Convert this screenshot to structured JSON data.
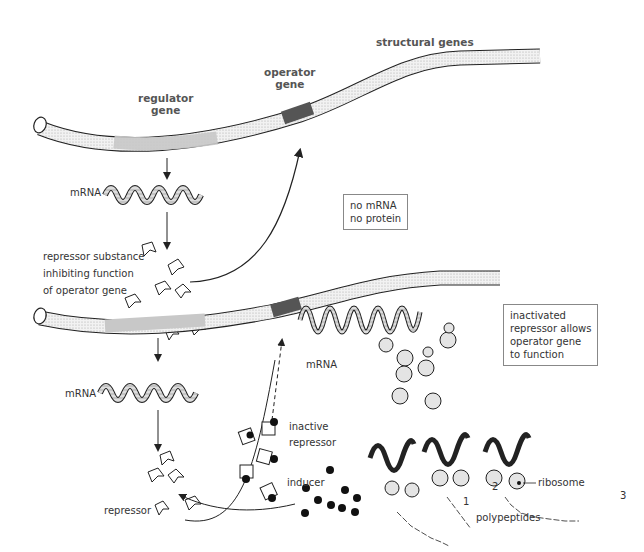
{
  "colors": {
    "background": "#ffffff",
    "ink": "#222222",
    "operator": "#555555",
    "regulator": "#c8c8c8",
    "segment": "#e8e8e8"
  },
  "top_panel": {
    "labels": {
      "regulator_gene": [
        "regulator",
        "gene"
      ],
      "operator_gene": [
        "operator",
        "gene"
      ],
      "structural_genes": "structural genes",
      "mrna": "mRNA",
      "repressor_substance": [
        "repressor substance",
        "inhibiting function",
        "of operator gene"
      ]
    },
    "note_box": [
      "no mRNA",
      "no protein"
    ]
  },
  "bottom_panel": {
    "labels": {
      "mrna_left": "mRNA",
      "mrna_right": "mRNA",
      "repressor": "repressor",
      "inactive_repressor": [
        "inactive",
        "repressor"
      ],
      "inducer": "inducer",
      "ribosome": "ribosome",
      "polypeptides": "polypeptides",
      "polypeptide_numbers": [
        "1",
        "2",
        "3"
      ]
    },
    "note_box": [
      "inactivated",
      "repressor allows",
      "operator gene",
      "to function"
    ]
  }
}
